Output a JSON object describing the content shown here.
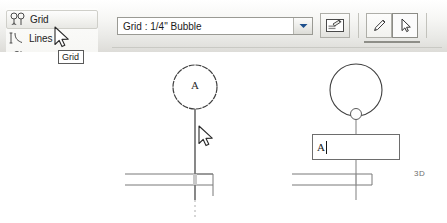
{
  "app": {
    "name": "Revit Grid Tool"
  },
  "menu_panel": {
    "items": [
      {
        "label": "Grid",
        "icon": "grid-bubble-icon",
        "selected": true
      },
      {
        "label": "Lines",
        "icon": "lines-icon",
        "selected": false
      },
      {
        "label": "Ref Planes",
        "icon": "ref-planes-icon",
        "selected": false
      }
    ]
  },
  "tooltip": {
    "text": "Grid"
  },
  "toolbar": {
    "type_selector": {
      "value": "Grid : 1/4\" Bubble",
      "placeholder": "Grid : 1/4\" Bubble",
      "arrow_icon": "chevron-down-icon"
    },
    "properties_button": {
      "label": "Element Properties",
      "icon": "element-properties-icon"
    },
    "draw_line_button": {
      "label": "Draw Line",
      "icon": "pencil-icon",
      "active": false
    },
    "pick_button": {
      "label": "Pick",
      "icon": "arrow-cursor-icon",
      "active": true
    }
  },
  "canvas": {
    "view_label": "3D",
    "left_grid": {
      "bubble_label": "A",
      "cursor_icon": "arrow-cursor-icon"
    },
    "right_grid": {
      "bubble_label": "A",
      "edit_value": "A",
      "grip_icon": "drag-grip-icon"
    }
  },
  "colors": {
    "toolbar_top": "#ffffff",
    "toolbar_bottom": "#dddcd8",
    "canvas_bg": "#ffffff",
    "line_ink": "#4a4a4a",
    "wall_ink": "#6a6a6a",
    "text_ink": "#1a1a1a",
    "border": "#9a9a94"
  }
}
